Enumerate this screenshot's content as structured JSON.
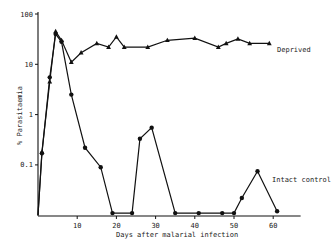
{
  "chart_data": {
    "type": "line",
    "title": "",
    "xlabel": "Days after malarial infection",
    "ylabel": "% Parasitaemia",
    "yscale": "log",
    "xlim": [
      0,
      68
    ],
    "ylim": [
      0.01,
      100
    ],
    "x_ticks": [
      10,
      20,
      30,
      40,
      50,
      60
    ],
    "y_ticks": [
      "100",
      "10",
      "1",
      "0.1"
    ],
    "grid": false,
    "legend": "inline labels",
    "series": [
      {
        "name": "Deprived",
        "marker": "triangle",
        "x": [
          0,
          1,
          3,
          4.5,
          6,
          8.5,
          11,
          15,
          18,
          20,
          22,
          28,
          33,
          40,
          46,
          48,
          51,
          54,
          59
        ],
        "y": [
          0.01,
          0.18,
          4.5,
          45,
          30,
          11,
          17,
          26,
          22,
          35,
          22,
          22,
          30,
          33,
          22,
          26,
          32,
          26,
          26
        ]
      },
      {
        "name": "Intact control",
        "marker": "circle",
        "x": [
          0,
          1,
          3,
          4.5,
          6,
          8.5,
          12,
          16,
          19,
          24,
          26,
          29,
          35,
          41,
          47,
          50,
          52,
          56,
          61
        ],
        "y": [
          0.01,
          0.17,
          5.5,
          40,
          28,
          2.5,
          0.22,
          0.09,
          0.011,
          0.011,
          0.33,
          0.55,
          0.011,
          0.011,
          0.011,
          0.011,
          0.022,
          0.075,
          0.012
        ]
      }
    ]
  },
  "axes": {
    "y_label": "% Parasitaemia",
    "x_label": "Days after malarial infection",
    "y_tick_labels": [
      "100",
      "10",
      "1",
      "0.1"
    ],
    "x_tick_labels": [
      "10",
      "20",
      "30",
      "40",
      "50",
      "60"
    ]
  },
  "labels": {
    "deprived": "Deprived",
    "intact": "Intact control"
  }
}
